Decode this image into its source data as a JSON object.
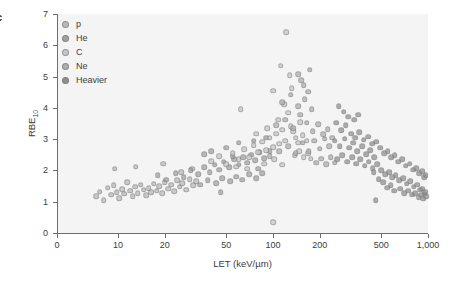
{
  "panel": {
    "letter": "c"
  },
  "axes": {
    "x": {
      "label_text": "LET (keV/µm)",
      "scale": "log",
      "ticks": [
        "0",
        "10",
        "20",
        "50",
        "100",
        "200",
        "500",
        "1,000"
      ],
      "tick_values": [
        0,
        10,
        20,
        50,
        100,
        200,
        500,
        1000
      ]
    },
    "y": {
      "label_prefix": "RBE",
      "label_subscript": "10",
      "label_text": "RBE10",
      "scale": "linear",
      "ticks": [
        "0",
        "1",
        "2",
        "3",
        "4",
        "5",
        "6",
        "7"
      ],
      "tick_values": [
        0,
        1,
        2,
        3,
        4,
        5,
        6,
        7
      ]
    }
  },
  "legend": {
    "position": "top-left-inside",
    "entries": [
      {
        "label": "p",
        "color": "#b9b9b9"
      },
      {
        "label": "He",
        "color": "#a0a0a0"
      },
      {
        "label": "C",
        "color": "#c6c6c6"
      },
      {
        "label": "Ne",
        "color": "#adadad"
      },
      {
        "label": "Heavier",
        "color": "#8f8f8f"
      }
    ]
  },
  "style": {
    "plot_background": "#f4f4f4",
    "page_background": "#ffffff",
    "axis_color": "#6e6e6e",
    "text_color": "#3c3c3c",
    "marker_color": "#9d9d9d",
    "marker_diameter_px": 3.6,
    "marker_opacity": 0.72
  },
  "chart_data": {
    "type": "scatter",
    "title": "",
    "xlabel": "LET (keV/µm)",
    "ylabel": "RBE10",
    "xscale": "log",
    "yscale": "linear",
    "xlim": [
      5,
      1000
    ],
    "ylim": [
      0,
      7
    ],
    "grid": false,
    "legend_position": "upper left",
    "series": [
      {
        "name": "p",
        "color": "#b9b9b9",
        "points": [
          [
            7.2,
            1.18
          ],
          [
            7.6,
            1.32
          ],
          [
            8.1,
            1.05
          ],
          [
            8.6,
            1.45
          ],
          [
            9.0,
            1.22
          ],
          [
            9.4,
            1.52
          ],
          [
            9.8,
            1.3
          ],
          [
            10.2,
            1.12
          ],
          [
            10.6,
            1.4
          ],
          [
            11.0,
            1.25
          ],
          [
            11.5,
            1.62
          ],
          [
            12.0,
            1.35
          ],
          [
            12.4,
            1.18
          ],
          [
            12.9,
            1.48
          ],
          [
            13.4,
            1.28
          ],
          [
            14.0,
            1.55
          ],
          [
            14.6,
            1.38
          ],
          [
            15.2,
            1.2
          ],
          [
            15.8,
            1.44
          ],
          [
            16.4,
            1.3
          ],
          [
            17.0,
            1.58
          ],
          [
            17.8,
            1.35
          ],
          [
            18.5,
            1.5
          ],
          [
            19.2,
            1.28
          ],
          [
            20.0,
            1.62
          ],
          [
            21.0,
            1.42
          ],
          [
            22.0,
            1.55
          ],
          [
            23.0,
            1.33
          ],
          [
            24.0,
            1.68
          ],
          [
            25.0,
            1.48
          ],
          [
            26.0,
            1.6
          ],
          [
            27.5,
            1.38
          ],
          [
            29.0,
            1.72
          ],
          [
            30.5,
            1.52
          ],
          [
            32.0,
            1.65
          ],
          [
            9.5,
            2.05
          ],
          [
            13.0,
            2.12
          ],
          [
            19.5,
            2.22
          ],
          [
            25.5,
            1.95
          ],
          [
            30.0,
            2.05
          ]
        ]
      },
      {
        "name": "He",
        "color": "#a0a0a0",
        "points": [
          [
            18.0,
            1.85
          ],
          [
            20.5,
            1.7
          ],
          [
            23.5,
            1.92
          ],
          [
            26.5,
            1.78
          ],
          [
            29.5,
            2.0
          ],
          [
            33.0,
            1.88
          ],
          [
            36.0,
            2.1
          ],
          [
            39.0,
            1.95
          ],
          [
            42.0,
            2.18
          ],
          [
            45.0,
            2.02
          ],
          [
            48.0,
            2.28
          ],
          [
            52.0,
            2.1
          ],
          [
            56.0,
            2.35
          ],
          [
            60.0,
            2.18
          ],
          [
            64.0,
            2.42
          ],
          [
            68.0,
            2.25
          ],
          [
            72.0,
            2.5
          ],
          [
            77.0,
            2.32
          ],
          [
            82.0,
            2.58
          ],
          [
            88.0,
            2.4
          ],
          [
            34.0,
            1.55
          ],
          [
            38.0,
            1.68
          ],
          [
            43.0,
            1.6
          ],
          [
            47.0,
            1.75
          ],
          [
            53.0,
            1.65
          ],
          [
            58.0,
            1.8
          ],
          [
            63.0,
            1.7
          ],
          [
            70.0,
            1.88
          ],
          [
            78.0,
            1.75
          ],
          [
            85.0,
            1.92
          ],
          [
            40.0,
            2.62
          ],
          [
            50.0,
            2.72
          ],
          [
            60.0,
            2.88
          ],
          [
            75.0,
            2.95
          ],
          [
            90.0,
            3.05
          ],
          [
            36.0,
            2.52
          ],
          [
            46.0,
            1.3
          ],
          [
            55.0,
            2.45
          ],
          [
            80.0,
            2.05
          ],
          [
            95.0,
            2.62
          ]
        ]
      },
      {
        "name": "C",
        "color": "#c6c6c6",
        "points": [
          [
            40.0,
            2.3
          ],
          [
            45.0,
            2.45
          ],
          [
            50.0,
            2.2
          ],
          [
            55.0,
            2.55
          ],
          [
            60.0,
            2.35
          ],
          [
            65.0,
            2.68
          ],
          [
            70.0,
            2.42
          ],
          [
            75.0,
            2.8
          ],
          [
            80.0,
            2.58
          ],
          [
            85.0,
            2.92
          ],
          [
            90.0,
            2.65
          ],
          [
            95.0,
            3.05
          ],
          [
            100.0,
            2.75
          ],
          [
            105.0,
            3.18
          ],
          [
            110.0,
            2.85
          ],
          [
            115.0,
            3.3
          ],
          [
            120.0,
            2.95
          ],
          [
            130.0,
            3.42
          ],
          [
            140.0,
            3.05
          ],
          [
            150.0,
            3.55
          ],
          [
            62.0,
            3.95
          ],
          [
            78.0,
            3.18
          ],
          [
            92.0,
            3.35
          ],
          [
            108.0,
            3.62
          ],
          [
            118.0,
            4.12
          ],
          [
            125.0,
            3.85
          ],
          [
            135.0,
            3.25
          ],
          [
            145.0,
            2.88
          ],
          [
            155.0,
            3.12
          ],
          [
            165.0,
            2.95
          ],
          [
            100.0,
            4.55
          ],
          [
            112.0,
            5.35
          ],
          [
            122.0,
            6.42
          ],
          [
            128.0,
            5.05
          ],
          [
            132.0,
            4.62
          ],
          [
            58.0,
            2.12
          ],
          [
            68.0,
            2.05
          ],
          [
            88.0,
            2.22
          ],
          [
            102.0,
            2.35
          ],
          [
            115.0,
            2.18
          ],
          [
            138.0,
            2.48
          ],
          [
            148.0,
            2.62
          ],
          [
            158.0,
            2.42
          ],
          [
            168.0,
            2.55
          ],
          [
            175.0,
            2.38
          ],
          [
            100.0,
            0.35
          ]
        ]
      },
      {
        "name": "Ne",
        "color": "#adadad",
        "points": [
          [
            95.0,
            2.45
          ],
          [
            110.0,
            2.62
          ],
          [
            125.0,
            2.78
          ],
          [
            140.0,
            2.55
          ],
          [
            155.0,
            2.88
          ],
          [
            170.0,
            2.62
          ],
          [
            185.0,
            2.95
          ],
          [
            200.0,
            2.7
          ],
          [
            215.0,
            3.02
          ],
          [
            230.0,
            2.78
          ],
          [
            105.0,
            3.45
          ],
          [
            120.0,
            3.62
          ],
          [
            135.0,
            3.35
          ],
          [
            150.0,
            3.78
          ],
          [
            165.0,
            3.52
          ],
          [
            180.0,
            3.25
          ],
          [
            195.0,
            3.48
          ],
          [
            210.0,
            3.15
          ],
          [
            225.0,
            3.32
          ],
          [
            240.0,
            3.05
          ],
          [
            115.0,
            4.18
          ],
          [
            130.0,
            4.42
          ],
          [
            145.0,
            4.05
          ],
          [
            160.0,
            4.28
          ],
          [
            178.0,
            3.95
          ],
          [
            190.0,
            2.25
          ],
          [
            205.0,
            2.38
          ],
          [
            220.0,
            2.2
          ],
          [
            235.0,
            2.42
          ],
          [
            250.0,
            2.25
          ],
          [
            145.0,
            5.08
          ],
          [
            158.0,
            4.72
          ],
          [
            172.0,
            5.22
          ],
          [
            168.0,
            4.52
          ],
          [
            152.0,
            4.88
          ]
        ]
      },
      {
        "name": "Heavier",
        "color": "#8f8f8f",
        "points": [
          [
            250.0,
            2.95
          ],
          [
            270.0,
            2.78
          ],
          [
            290.0,
            3.02
          ],
          [
            310.0,
            2.72
          ],
          [
            330.0,
            2.88
          ],
          [
            350.0,
            2.62
          ],
          [
            375.0,
            2.78
          ],
          [
            400.0,
            2.52
          ],
          [
            425.0,
            2.65
          ],
          [
            450.0,
            2.42
          ],
          [
            260.0,
            2.35
          ],
          [
            280.0,
            2.48
          ],
          [
            300.0,
            2.28
          ],
          [
            325.0,
            2.42
          ],
          [
            345.0,
            2.22
          ],
          [
            365.0,
            2.35
          ],
          [
            390.0,
            2.15
          ],
          [
            415.0,
            2.28
          ],
          [
            440.0,
            2.08
          ],
          [
            470.0,
            2.2
          ],
          [
            500.0,
            2.0
          ],
          [
            530.0,
            1.88
          ],
          [
            560.0,
            1.95
          ],
          [
            590.0,
            1.78
          ],
          [
            620.0,
            1.85
          ],
          [
            650.0,
            1.68
          ],
          [
            690.0,
            1.75
          ],
          [
            730.0,
            1.58
          ],
          [
            770.0,
            1.65
          ],
          [
            810.0,
            1.48
          ],
          [
            850.0,
            1.55
          ],
          [
            890.0,
            1.38
          ],
          [
            920.0,
            1.42
          ],
          [
            950.0,
            1.25
          ],
          [
            975.0,
            1.18
          ],
          [
            255.0,
            3.52
          ],
          [
            275.0,
            3.28
          ],
          [
            295.0,
            3.45
          ],
          [
            320.0,
            3.18
          ],
          [
            340.0,
            3.05
          ],
          [
            360.0,
            3.22
          ],
          [
            385.0,
            2.98
          ],
          [
            410.0,
            3.08
          ],
          [
            435.0,
            2.85
          ],
          [
            465.0,
            2.92
          ],
          [
            490.0,
            2.72
          ],
          [
            520.0,
            2.55
          ],
          [
            550.0,
            2.62
          ],
          [
            580.0,
            2.42
          ],
          [
            610.0,
            2.48
          ],
          [
            640.0,
            2.28
          ],
          [
            680.0,
            2.35
          ],
          [
            720.0,
            2.15
          ],
          [
            760.0,
            2.22
          ],
          [
            800.0,
            2.02
          ],
          [
            840.0,
            2.08
          ],
          [
            880.0,
            1.92
          ],
          [
            915.0,
            1.98
          ],
          [
            945.0,
            1.78
          ],
          [
            965.0,
            1.85
          ],
          [
            265.0,
            4.05
          ],
          [
            285.0,
            3.88
          ],
          [
            305.0,
            3.72
          ],
          [
            335.0,
            3.62
          ],
          [
            355.0,
            3.78
          ],
          [
            445.0,
            1.95
          ],
          [
            480.0,
            1.72
          ],
          [
            515.0,
            1.62
          ],
          [
            545.0,
            1.45
          ],
          [
            575.0,
            1.52
          ],
          [
            605.0,
            1.35
          ],
          [
            660.0,
            1.42
          ],
          [
            700.0,
            1.28
          ],
          [
            745.0,
            1.35
          ],
          [
            790.0,
            1.22
          ],
          [
            830.0,
            1.28
          ],
          [
            870.0,
            1.15
          ],
          [
            905.0,
            1.22
          ],
          [
            935.0,
            1.1
          ],
          [
            958.0,
            1.32
          ],
          [
            460.0,
            1.05
          ]
        ]
      }
    ]
  }
}
